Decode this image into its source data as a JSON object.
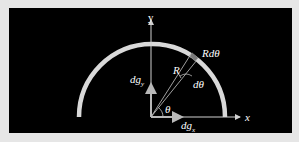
{
  "diagram": {
    "type": "semicircular-arc-gravitational-field",
    "background_color": "#000000",
    "frame_color": "#e6e6e6",
    "arc_color": "#d9d9d9",
    "segment_color": "#7a7a7a",
    "axis_color": "#d0d0d0",
    "labels": {
      "y_axis": "y",
      "x_axis": "x",
      "arc_element": "Rdθ",
      "radius": "R",
      "d_theta": "dθ",
      "theta": "θ",
      "dg_y": "dg",
      "dg_y_sub": "y",
      "dg_x": "dg",
      "dg_x_sub": "x"
    }
  }
}
